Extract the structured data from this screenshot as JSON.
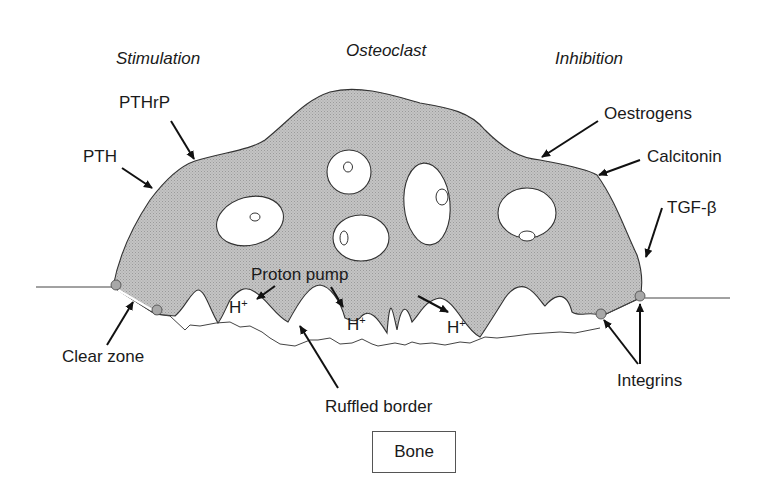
{
  "diagram": {
    "title": "Osteoclast",
    "headers": {
      "stimulation": "Stimulation",
      "osteoclast": "Osteoclast",
      "inhibition": "Inhibition"
    },
    "stimulators": [
      {
        "label": "PTHrP"
      },
      {
        "label": "PTH"
      }
    ],
    "inhibitors": [
      {
        "label": "Oestrogens"
      },
      {
        "label": "Calcitonin"
      },
      {
        "label": "TGF-β"
      }
    ],
    "structures": {
      "proton_pump": "Proton pump",
      "clear_zone": "Clear zone",
      "ruffled_border": "Ruffled border",
      "integrins": "Integrins",
      "bone": "Bone"
    },
    "ions": [
      {
        "symbol": "H",
        "charge": "+"
      },
      {
        "symbol": "H",
        "charge": "+"
      },
      {
        "symbol": "H",
        "charge": "+"
      }
    ],
    "nuclei_count": 5,
    "colors": {
      "cell_fill": "#bdbdbd",
      "outline": "#333333",
      "arrow": "#111111",
      "integrin_fill": "#a8a8a8",
      "background": "#ffffff"
    }
  }
}
